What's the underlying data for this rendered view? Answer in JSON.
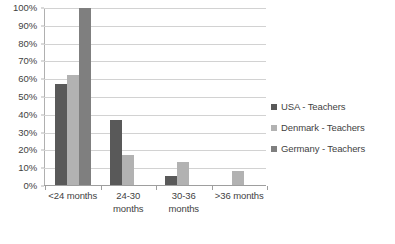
{
  "chart_data": {
    "type": "bar",
    "title": "",
    "subtitle": "",
    "xlabel": "",
    "ylabel": "",
    "categories": [
      "<24 months",
      "24-30 months",
      "30-36 months",
      ">36 months"
    ],
    "series": [
      {
        "name": "USA - Teachers",
        "color": "#595959",
        "values": [
          57,
          37,
          5,
          0
        ]
      },
      {
        "name": "Denmark - Teachers",
        "color": "#b2b2b2",
        "values": [
          62,
          17,
          13,
          8
        ]
      },
      {
        "name": "Germany - Teachers",
        "color": "#7f7f7f",
        "values": [
          100,
          0,
          0,
          0
        ]
      }
    ],
    "ylim": [
      0,
      100
    ],
    "ytick_values": [
      0,
      10,
      20,
      30,
      40,
      50,
      60,
      70,
      80,
      90,
      100
    ],
    "ytick_labels": [
      "0%",
      "10%",
      "20%",
      "30%",
      "40%",
      "50%",
      "60%",
      "70%",
      "80%",
      "90%",
      "100%"
    ],
    "grid": true,
    "grid_axis": "y",
    "legend_position": "right",
    "value_suffix": "%"
  },
  "colors": {
    "gridline": "#d2d2d2",
    "axis": "#9e9e9e",
    "text": "#3f3f3f",
    "background": "#ffffff"
  }
}
